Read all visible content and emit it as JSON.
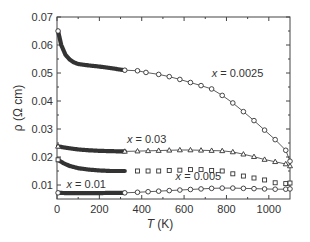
{
  "chart_data": {
    "type": "line",
    "title": "",
    "xlabel": "T (K)",
    "ylabel": "ρ (Ω cm)",
    "xlim": [
      0,
      1100
    ],
    "ylim": [
      0.005,
      0.07
    ],
    "xticks": [
      0,
      200,
      400,
      600,
      800,
      1000
    ],
    "yticks": [
      0.01,
      0.02,
      0.03,
      0.04,
      0.05,
      0.06,
      0.07
    ],
    "xtick_labels": [
      "0",
      "200",
      "400",
      "600",
      "800",
      "1000"
    ],
    "ytick_labels": [
      "0.01",
      "0.02",
      "0.03",
      "0.04",
      "0.05",
      "0.06",
      "0.07"
    ],
    "grid": false,
    "legend": "none (inline annotations)",
    "series": [
      {
        "name": "x = 0.0025",
        "label": "x = 0.0025",
        "marker": "circle",
        "line": true,
        "low_T": {
          "x": [
            5,
            20,
            40,
            60,
            80,
            100,
            150,
            200,
            250,
            300,
            320
          ],
          "y": [
            0.065,
            0.06,
            0.0565,
            0.0548,
            0.0538,
            0.0532,
            0.0527,
            0.0523,
            0.0518,
            0.0512,
            0.051
          ]
        },
        "high_T": {
          "x": [
            320,
            380,
            420,
            480,
            530,
            580,
            630,
            680,
            730,
            780,
            830,
            880,
            930,
            980,
            1030,
            1080,
            1100
          ],
          "y": [
            0.051,
            0.0508,
            0.0502,
            0.0495,
            0.0487,
            0.0477,
            0.0466,
            0.0455,
            0.0443,
            0.042,
            0.0393,
            0.0362,
            0.033,
            0.0296,
            0.0262,
            0.0224,
            0.0185
          ]
        },
        "annotation": {
          "text": "x = 0.0025",
          "x": 730,
          "y": 0.0485
        }
      },
      {
        "name": "x = 0.03",
        "label": "x = 0.03",
        "marker": "triangle",
        "line": true,
        "low_T": {
          "x": [
            5,
            50,
            100,
            150,
            200,
            250,
            300,
            320
          ],
          "y": [
            0.0238,
            0.0232,
            0.0227,
            0.0224,
            0.0222,
            0.0221,
            0.022,
            0.022
          ]
        },
        "high_T": {
          "x": [
            320,
            380,
            430,
            480,
            530,
            580,
            630,
            680,
            730,
            780,
            830,
            880,
            930,
            980,
            1030,
            1080,
            1100
          ],
          "y": [
            0.022,
            0.0221,
            0.0222,
            0.0223,
            0.0224,
            0.0225,
            0.0225,
            0.0224,
            0.0223,
            0.0222,
            0.0218,
            0.021,
            0.0201,
            0.0191,
            0.0183,
            0.0175,
            0.0168
          ]
        },
        "annotation": {
          "text": "x = 0.03",
          "x": 330,
          "y": 0.025
        }
      },
      {
        "name": "x = 0.005",
        "label": "x = 0.005",
        "marker": "square",
        "line": false,
        "low_T": {
          "x": [
            5,
            30,
            60,
            100,
            150,
            200,
            250,
            300,
            320
          ],
          "y": [
            0.019,
            0.0178,
            0.0168,
            0.016,
            0.0155,
            0.0152,
            0.015,
            0.015,
            0.015
          ]
        },
        "high_T": {
          "x": [
            380,
            430,
            480,
            530,
            580,
            630,
            680,
            730,
            780,
            830,
            880,
            930,
            980,
            1030,
            1080,
            1100
          ],
          "y": [
            0.015,
            0.015,
            0.015,
            0.0152,
            0.0153,
            0.0155,
            0.0155,
            0.0152,
            0.015,
            0.014,
            0.0132,
            0.0125,
            0.0118,
            0.0108,
            0.0105,
            0.0107
          ]
        },
        "annotation": {
          "text": "x = 0.005",
          "x": 560,
          "y": 0.0118
        }
      },
      {
        "name": "x = 0.01",
        "label": "x = 0.01",
        "marker": "circle",
        "line": true,
        "low_T": {
          "x": [
            5,
            50,
            100,
            150,
            200,
            250,
            300,
            320
          ],
          "y": [
            0.0072,
            0.0071,
            0.0071,
            0.0071,
            0.0071,
            0.0072,
            0.0072,
            0.0072
          ]
        },
        "high_T": {
          "x": [
            320,
            380,
            430,
            480,
            530,
            580,
            630,
            680,
            730,
            780,
            830,
            880,
            930,
            980,
            1030,
            1080,
            1100
          ],
          "y": [
            0.0072,
            0.0074,
            0.0076,
            0.0078,
            0.008,
            0.0082,
            0.0084,
            0.0086,
            0.0088,
            0.0089,
            0.0089,
            0.0088,
            0.0087,
            0.0086,
            0.0085,
            0.0085,
            0.0086
          ]
        },
        "annotation": {
          "text": "x = 0.01",
          "x": 45,
          "y": 0.0088
        }
      }
    ]
  },
  "labels": {
    "xlabel_italic": "T",
    "xlabel_unit": " (K)",
    "ylabel": "ρ (Ω cm)"
  },
  "annotations": {
    "a0025": "x = 0.0025",
    "a003": "x = 0.03",
    "a0005": "x = 0.005",
    "a001": "x = 0.01"
  },
  "colors": {
    "line": "#333333",
    "axis": "#444444",
    "background": "#ffffff"
  }
}
